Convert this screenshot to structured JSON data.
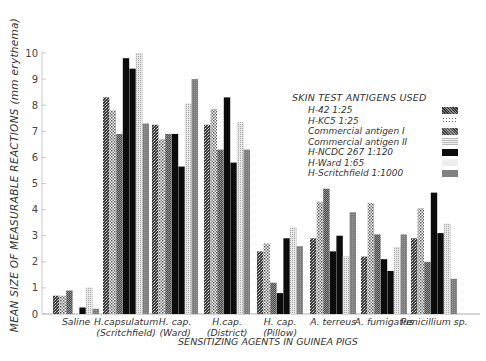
{
  "chart_data": {
    "type": "bar",
    "title": "",
    "ylabel": "MEAN SIZE OF MEASURABLE REACTIONS (mm erythema)",
    "xlabel": "SENSITIZING AGENTS IN GUINEA PIGS",
    "ylim": [
      0,
      10
    ],
    "yticks": [
      0,
      1,
      2,
      3,
      4,
      5,
      6,
      7,
      8,
      9,
      10
    ],
    "grid": false,
    "legend_title": "SKIN TEST ANTIGENS USED",
    "legend_position": "upper right",
    "categories": [
      "Saline",
      "H.capsulatum (Scritchfield)",
      "H. cap. (Ward)",
      "H.cap. (District)",
      "H. cap. (Pillow)",
      "A. terreus",
      "A. fumigatus",
      "Penicillium sp."
    ],
    "category_lines": [
      [
        "Saline"
      ],
      [
        "H.capsulatum",
        "(Scritchfield)"
      ],
      [
        "H. cap.",
        "(Ward)"
      ],
      [
        "H.cap.",
        "(District)"
      ],
      [
        "H. cap.",
        "(Pillow)"
      ],
      [
        "A. terreus"
      ],
      [
        "A. fumigatus"
      ],
      [
        "Penicillium sp."
      ]
    ],
    "series": [
      {
        "name": "H-42 1:25",
        "pattern": "speckle-dark",
        "values": [
          0.7,
          8.3,
          7.25,
          7.25,
          2.4,
          2.9,
          2.2,
          2.9
        ]
      },
      {
        "name": "H-KC5 1:25",
        "pattern": "dots",
        "values": [
          0.7,
          7.8,
          6.7,
          7.85,
          2.7,
          4.3,
          4.25,
          4.05
        ]
      },
      {
        "name": "Commercial antigen I",
        "pattern": "crosshatch",
        "values": [
          0.9,
          6.9,
          6.9,
          6.3,
          1.2,
          4.8,
          3.05,
          2.0
        ]
      },
      {
        "name": "Commercial antigen II",
        "pattern": "black",
        "values": [
          0.0,
          9.8,
          6.9,
          8.3,
          0.8,
          2.4,
          2.1,
          4.65
        ]
      },
      {
        "name": "H-NCDC 267 1:120",
        "pattern": "black",
        "values": [
          0.25,
          9.4,
          5.65,
          5.8,
          2.9,
          3.0,
          1.65,
          3.1
        ]
      },
      {
        "name": "H-Ward 1:65",
        "pattern": "light-dots",
        "values": [
          1.0,
          10.0,
          8.05,
          7.35,
          3.3,
          2.2,
          2.55,
          3.45
        ]
      },
      {
        "name": "H-Scritchfield 1:1000",
        "pattern": "gray",
        "values": [
          0.2,
          7.3,
          9.0,
          6.3,
          2.6,
          3.9,
          3.05,
          1.35
        ]
      }
    ]
  },
  "axes": {
    "y_label": "MEAN SIZE OF MEASURABLE REACTIONS (mm erythema)",
    "x_label": "SENSITIZING AGENTS IN GUINEA PIGS"
  },
  "legend": {
    "title": "SKIN TEST ANTIGENS USED",
    "items": [
      "H-42 1:25",
      "H-KC5 1:25",
      "Commercial antigen I",
      "Commercial antigen II",
      "H-NCDC 267 1:120",
      "H-Ward 1:65",
      "H-Scritchfield 1:1000"
    ]
  }
}
